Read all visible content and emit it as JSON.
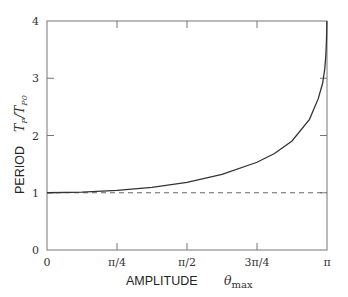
{
  "chart_data": {
    "type": "line",
    "title": "",
    "xlabel": "AMPLITUDE θmax",
    "ylabel": "PERIOD T_P/T_P0",
    "xlabel_word": "AMPLITUDE",
    "xlabel_symbol": "θ",
    "xlabel_sub": "max",
    "ylabel_word": "PERIOD",
    "ylabel_symbol": "T_P/T_P0",
    "xlim": [
      0,
      3.14159
    ],
    "ylim": [
      0,
      4
    ],
    "grid": false,
    "legend": null,
    "x_tick_labels": [
      "0",
      "π/4",
      "π/2",
      "3π/4",
      "π"
    ],
    "x_tick_values": [
      0,
      0.7854,
      1.5708,
      2.3562,
      3.14159
    ],
    "y_tick_labels": [
      "0",
      "1",
      "2",
      "3",
      "4"
    ],
    "y_tick_values": [
      0,
      1,
      2,
      3,
      4
    ],
    "series": [
      {
        "name": "exact period ratio",
        "style": "solid",
        "x": [
          0,
          0.3927,
          0.7854,
          1.1781,
          1.5708,
          1.9635,
          2.3562,
          2.5525,
          2.7489,
          2.9452,
          3.0434,
          3.0925,
          3.117,
          3.1293,
          3.1366,
          3.14
        ],
        "values": [
          1.0,
          1.01,
          1.04,
          1.093,
          1.18,
          1.32,
          1.533,
          1.686,
          1.904,
          2.282,
          2.644,
          2.912,
          3.17,
          3.414,
          3.7,
          4.0
        ]
      },
      {
        "name": "small-angle reference",
        "style": "dashed",
        "x": [
          0,
          3.14159
        ],
        "values": [
          1,
          1
        ]
      }
    ]
  }
}
